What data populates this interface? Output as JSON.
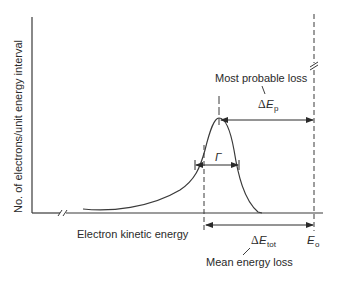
{
  "diagram": {
    "type": "electron energy loss distribution",
    "y_axis_label": "No. of electrons/unit energy interval",
    "x_axis_label": "Electron kinetic energy",
    "annotations": {
      "most_probable_loss": "Most probable loss",
      "delta_ep_prefix": "Δ",
      "delta_ep_symbol": "E",
      "delta_ep_sub": "p",
      "gamma": "Γ",
      "delta_etot_prefix": "Δ",
      "delta_etot_symbol": "E",
      "delta_etot_sub": "tot",
      "e0_symbol": "E",
      "e0_sub": "o",
      "mean_energy_loss": "Mean energy loss"
    },
    "colors": {
      "line": "#3a3a3a",
      "text": "#2a2a2a",
      "background": "#ffffff"
    }
  }
}
